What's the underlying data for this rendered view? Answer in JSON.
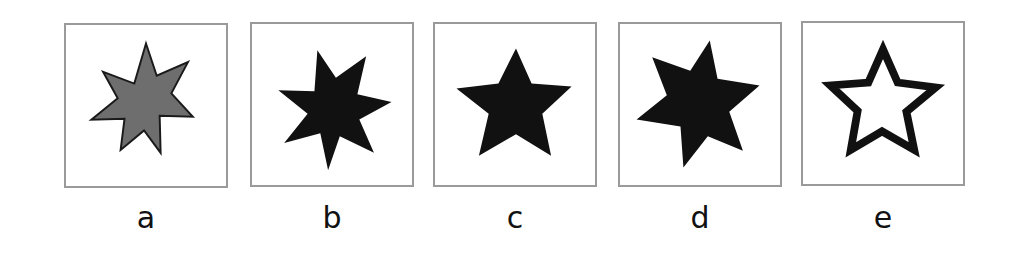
{
  "figure": {
    "panels": [
      {
        "label": "a",
        "shape": "seven-pointed-star",
        "points": 7,
        "fill": "#6e6e6e",
        "stroke": "#1a1a1a",
        "rotation": 0
      },
      {
        "label": "b",
        "shape": "seven-pointed-star",
        "points": 7,
        "fill": "#111111",
        "stroke": "#111111",
        "rotation": 8
      },
      {
        "label": "c",
        "shape": "five-pointed-star",
        "points": 5,
        "fill": "#111111",
        "stroke": "#111111",
        "rotation": 0
      },
      {
        "label": "d",
        "shape": "six-pointed-star",
        "points": 6,
        "fill": "#111111",
        "stroke": "#111111",
        "rotation": 12
      },
      {
        "label": "e",
        "shape": "five-pointed-star-outline",
        "points": 5,
        "fill": "#ffffff",
        "stroke": "#111111",
        "rotation": 0
      }
    ],
    "border_color": "#9a9a9a"
  }
}
